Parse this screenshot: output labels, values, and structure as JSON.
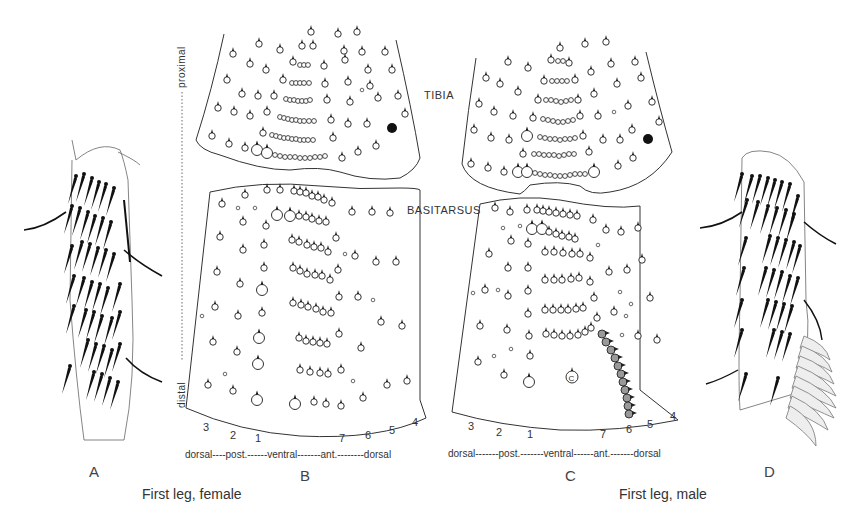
{
  "figure": {
    "panels": [
      {
        "id": "A",
        "letter": "A",
        "description": "First leg female, whole segment drawing with setae"
      },
      {
        "id": "B",
        "letter": "B",
        "description": "Female tibia and basitarsus setal map"
      },
      {
        "id": "C",
        "letter": "C",
        "description": "Male tibia and basitarsus setal map"
      },
      {
        "id": "D",
        "letter": "D",
        "description": "First leg male, whole segment drawing with setae and comb"
      }
    ],
    "captions": {
      "female": "First leg, female",
      "male": "First leg, male"
    },
    "segment_labels": {
      "tibia": "TIBIA",
      "basitarsus": "BASITARSUS"
    },
    "axis": {
      "proximal": "proximal",
      "distal": "distal"
    },
    "row_numbers_B": [
      "3",
      "2",
      "1",
      "7",
      "6",
      "5",
      "4"
    ],
    "row_numbers_C": [
      "3",
      "2",
      "1",
      "7",
      "6",
      "5",
      "4"
    ],
    "orientation_B": {
      "text": "dorsal----post.------ventral-------ant.--------dorsal"
    },
    "orientation_C": {
      "text": "dorsal-------post.-------ventral------ant.-------dorsal"
    },
    "special_marks": {
      "c_mark": "C"
    },
    "colors": {
      "line": "#333333",
      "filled_seta": "#111111",
      "comb_fill": "#999999",
      "background": "#ffffff"
    }
  }
}
